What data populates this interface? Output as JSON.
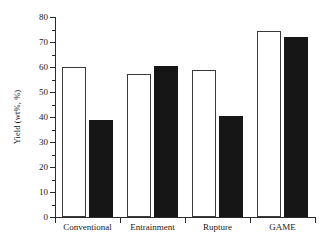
{
  "chart_data": {
    "type": "bar",
    "title": "",
    "subtitle": "",
    "xlabel": "",
    "ylabel": "Yield (wt%, %)",
    "ylim": [
      0,
      80
    ],
    "ytick_step": 10,
    "yminor_step": 5,
    "grid": false,
    "legend": "none",
    "categories": [
      "Conventional",
      "Entrainment",
      "Rupture",
      "GAME"
    ],
    "series": [
      {
        "name": "open",
        "fill": "#ffffff",
        "edge": "#3a3a3a",
        "values": [
          60.2,
          57.4,
          59.0,
          74.4
        ]
      },
      {
        "name": "filled",
        "fill": "#161616",
        "edge": "#161616",
        "values": [
          38.8,
          60.3,
          40.3,
          72.0
        ]
      }
    ],
    "ytick_labels": [
      "0",
      "10",
      "20",
      "30",
      "40",
      "50",
      "60",
      "70",
      "80"
    ],
    "ytick_values": [
      0,
      10,
      20,
      30,
      40,
      50,
      60,
      70,
      80
    ],
    "yminor_values": [
      5,
      15,
      25,
      35,
      45,
      55,
      65,
      75
    ],
    "annotations": []
  },
  "colors": {
    "axis": "#2b2b2b",
    "text": "#1a1a1a",
    "background": "#ffffff"
  }
}
